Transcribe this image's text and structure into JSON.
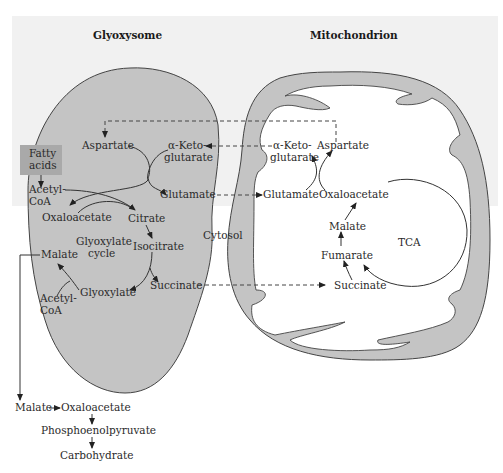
{
  "titles": {
    "glyoxysome": "Glyoxysome",
    "mitochondrion": "Mitochondrion"
  },
  "colors": {
    "organelle_fill": "#c4c4c4",
    "background_panel": "#f1f1f1",
    "fatty_acids_box": "#a9a9a9",
    "line": "#333333"
  },
  "glyoxysome": {
    "fatty_acids_line1": "Fatty",
    "fatty_acids_line2": "acids",
    "aspartate": "Aspartate",
    "akg_line1": "α-Keto-",
    "akg_line2": "glutarate",
    "glutamate": "Glutamate",
    "acetylcoa1_line1": "Acetyl-",
    "acetylcoa1_line2": "CoA",
    "oxaloacetate": "Oxaloacetate",
    "citrate": "Citrate",
    "cycle_line1": "Glyoxylate",
    "cycle_line2": "cycle",
    "isocitrate": "Isocitrate",
    "malate": "Malate",
    "glyoxylate": "Glyoxylate",
    "succinate": "Succinate",
    "acetylcoa2_line1": "Acetyl-",
    "acetylcoa2_line2": "CoA"
  },
  "cytosol": {
    "label": "Cytosol",
    "malate": "Malate",
    "oxaloacetate": "Oxaloacetate",
    "pep": "Phosphoenolpyruvate",
    "carbohydrate": "Carbohydrate"
  },
  "mitochondrion": {
    "akg_line1": "α-Keto-",
    "akg_line2": "glutarate",
    "aspartate": "Aspartate",
    "glutamate": "Glutamate",
    "oxaloacetate": "Oxaloacetate",
    "malate": "Malate",
    "tca": "TCA",
    "fumarate": "Fumarate",
    "succinate": "Succinate"
  }
}
